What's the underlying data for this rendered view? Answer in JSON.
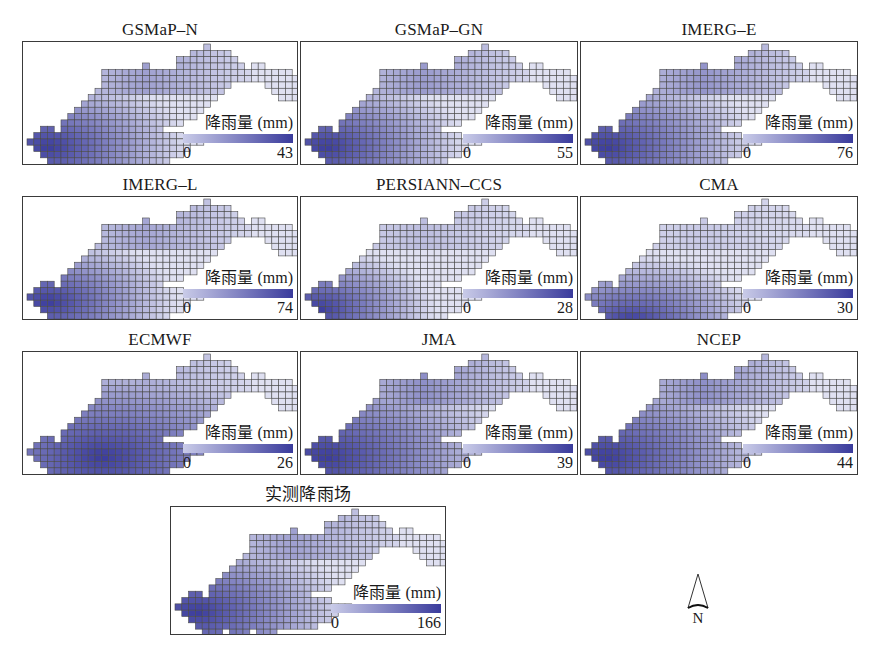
{
  "figure": {
    "legend_title": "降雨量 (mm)",
    "legend_colors": {
      "low": "#c9cbe8",
      "high": "#3a3b9c"
    },
    "north_label": "N",
    "panels": [
      {
        "title": "GSMaP–N",
        "min": "0",
        "max": "43",
        "x": 22,
        "y": 20,
        "w": 276,
        "h": 145,
        "cx": 0.05,
        "cy": 0.75,
        "spread": 0.55,
        "ridge": 0.55
      },
      {
        "title": "GSMaP–GN",
        "min": "0",
        "max": "55",
        "x": 300,
        "y": 20,
        "w": 278,
        "h": 145,
        "cx": 0.05,
        "cy": 0.75,
        "spread": 0.55,
        "ridge": 0.6
      },
      {
        "title": "IMERG–E",
        "min": "0",
        "max": "76",
        "x": 580,
        "y": 20,
        "w": 278,
        "h": 145,
        "cx": 0.05,
        "cy": 0.75,
        "spread": 0.6,
        "ridge": 0.65
      },
      {
        "title": "IMERG–L",
        "min": "0",
        "max": "74",
        "x": 22,
        "y": 175,
        "w": 276,
        "h": 145,
        "cx": 0.05,
        "cy": 0.75,
        "spread": 0.5,
        "ridge": 0.5
      },
      {
        "title": "PERSIANN–CCS",
        "min": "0",
        "max": "28",
        "x": 300,
        "y": 175,
        "w": 278,
        "h": 145,
        "cx": 0.03,
        "cy": 0.8,
        "spread": 0.45,
        "ridge": 0.3
      },
      {
        "title": "CMA",
        "min": "0",
        "max": "30",
        "x": 580,
        "y": 175,
        "w": 278,
        "h": 145,
        "cx": 0.12,
        "cy": 0.9,
        "spread": 0.5,
        "ridge": 0.2
      },
      {
        "title": "ECMWF",
        "min": "0",
        "max": "26",
        "x": 22,
        "y": 330,
        "w": 276,
        "h": 145,
        "cx": 0.2,
        "cy": 0.75,
        "spread": 0.8,
        "ridge": 0.45
      },
      {
        "title": "JMA",
        "min": "0",
        "max": "39",
        "x": 300,
        "y": 330,
        "w": 278,
        "h": 145,
        "cx": 0.05,
        "cy": 0.75,
        "spread": 0.75,
        "ridge": 0.7
      },
      {
        "title": "NCEP",
        "min": "0",
        "max": "44",
        "x": 580,
        "y": 330,
        "w": 278,
        "h": 145,
        "cx": 0.05,
        "cy": 0.75,
        "spread": 0.7,
        "ridge": 0.7
      },
      {
        "title": "实测降雨场",
        "min": "0",
        "max": "166",
        "x": 170,
        "y": 485,
        "w": 276,
        "h": 150,
        "cx": 0.05,
        "cy": 0.75,
        "spread": 0.6,
        "ridge": 0.55
      }
    ]
  }
}
